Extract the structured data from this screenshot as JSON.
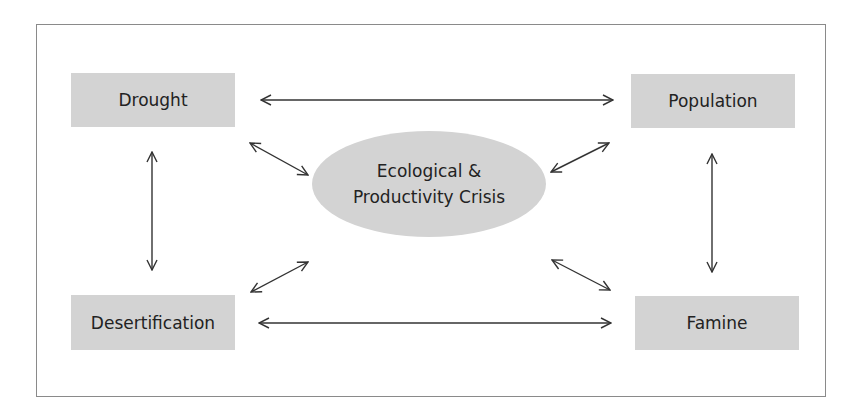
{
  "diagram": {
    "title": "",
    "center": {
      "line1": "Ecological &",
      "line2": "Productivity Crisis"
    },
    "nodes": {
      "top_left": "Drought",
      "top_right": "Population",
      "bottom_left": "Desertification",
      "bottom_right": "Famine"
    },
    "edges": [
      {
        "from": "Drought",
        "to": "Population",
        "type": "bidirectional"
      },
      {
        "from": "Desertification",
        "to": "Famine",
        "type": "bidirectional"
      },
      {
        "from": "Drought",
        "to": "Desertification",
        "type": "bidirectional"
      },
      {
        "from": "Population",
        "to": "Famine",
        "type": "bidirectional"
      },
      {
        "from": "Drought",
        "to": "Ecological & Productivity Crisis",
        "type": "bidirectional"
      },
      {
        "from": "Population",
        "to": "Ecological & Productivity Crisis",
        "type": "bidirectional"
      },
      {
        "from": "Desertification",
        "to": "Ecological & Productivity Crisis",
        "type": "bidirectional"
      },
      {
        "from": "Famine",
        "to": "Ecological & Productivity Crisis",
        "type": "bidirectional"
      }
    ],
    "colors": {
      "node_fill": "#d3d3d3",
      "arrow": "#333333",
      "frame": "#8a8a8a",
      "text": "#222222"
    }
  }
}
